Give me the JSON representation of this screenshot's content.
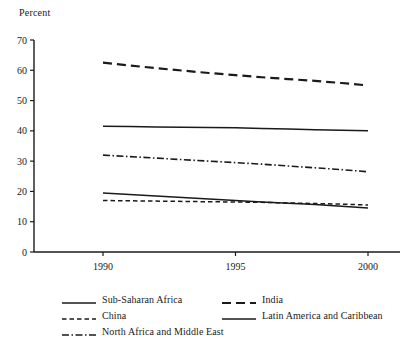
{
  "chart_data": {
    "type": "line",
    "title": "",
    "ylabel": "Percent",
    "xlabel": "",
    "ylim": [
      0,
      70
    ],
    "ytick_step": 10,
    "yticks": [
      0,
      10,
      20,
      30,
      40,
      50,
      60,
      70
    ],
    "xticks": [
      1990,
      1995,
      2000
    ],
    "xlim": [
      1990,
      2000
    ],
    "grid": false,
    "legend_position": "below",
    "x": [
      1990,
      1991,
      1992,
      1993,
      1994,
      1995,
      1996,
      1997,
      1998,
      1999,
      2000
    ],
    "series": [
      {
        "name": "India",
        "style": "long-dash",
        "color": "#1a1a1a",
        "values": [
          62.5,
          61.6,
          60.7,
          59.9,
          59.1,
          58.4,
          57.7,
          57.1,
          56.5,
          55.8,
          55.0
        ]
      },
      {
        "name": "Latin America and Caribbean",
        "style": "solid",
        "color": "#1a1a1a",
        "values": [
          41.5,
          41.4,
          41.3,
          41.2,
          41.1,
          41.0,
          40.8,
          40.6,
          40.4,
          40.2,
          40.0
        ]
      },
      {
        "name": "North Africa and Middle East",
        "style": "dash-dot",
        "color": "#1a1a1a",
        "values": [
          32.0,
          31.5,
          31.0,
          30.5,
          30.0,
          29.5,
          29.0,
          28.4,
          27.8,
          27.2,
          26.5
        ]
      },
      {
        "name": "Sub-Saharan Africa",
        "style": "solid",
        "color": "#1a1a1a",
        "values": [
          19.5,
          19.0,
          18.5,
          18.0,
          17.5,
          17.0,
          16.5,
          16.1,
          15.7,
          15.1,
          14.5
        ]
      },
      {
        "name": "China",
        "style": "short-dash",
        "color": "#1a1a1a",
        "values": [
          17.0,
          16.9,
          16.8,
          16.7,
          16.6,
          16.5,
          16.4,
          16.2,
          16.0,
          15.8,
          15.5
        ]
      }
    ],
    "ytick_labels": [
      "0",
      "10",
      "20",
      "30",
      "40",
      "50",
      "60",
      "70"
    ],
    "xtick_labels": [
      "1990",
      "1995",
      "2000"
    ]
  },
  "legend": {
    "left_column": [
      {
        "label": "Sub-Saharan Africa",
        "style": "solid"
      },
      {
        "label": "China",
        "style": "short-dash"
      },
      {
        "label": "North Africa and Middle East",
        "style": "dash-dot"
      }
    ],
    "right_column": [
      {
        "label": "India",
        "style": "long-dash"
      },
      {
        "label": "Latin America and Caribbean",
        "style": "solid"
      }
    ]
  }
}
